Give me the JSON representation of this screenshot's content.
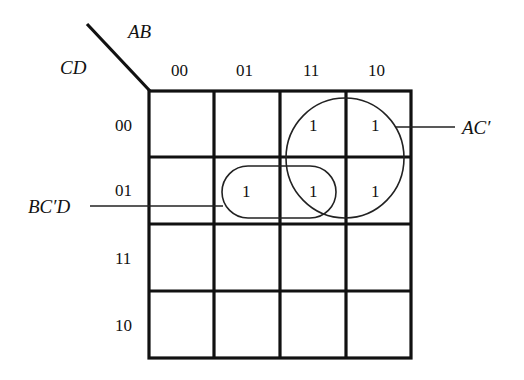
{
  "diagram": {
    "type": "karnaugh-map",
    "row_variable_label": "CD",
    "column_variable_label": "AB",
    "column_codes": [
      "00",
      "01",
      "11",
      "10"
    ],
    "row_codes": [
      "00",
      "01",
      "11",
      "10"
    ],
    "cells": [
      [
        "",
        "",
        "1",
        "1"
      ],
      [
        "",
        "1",
        "1",
        "1"
      ],
      [
        "",
        "",
        "",
        ""
      ],
      [
        "",
        "",
        "",
        ""
      ]
    ],
    "groups": [
      {
        "label": "AC'",
        "shape": "circle",
        "covers": "AB=11,10 × CD=00,01"
      },
      {
        "label": "BC'D",
        "shape": "rounded-rectangle",
        "covers": "AB=01,11 × CD=01"
      }
    ]
  },
  "labels": {
    "ab": "AB",
    "cd": "CD",
    "col_0": "00",
    "col_1": "01",
    "col_2": "11",
    "col_3": "10",
    "row_0": "00",
    "row_1": "01",
    "row_2": "11",
    "row_3": "10",
    "group_ac": "AC′",
    "group_bcd": "BC′D"
  },
  "cell_values": {
    "r0c2": "1",
    "r0c3": "1",
    "r1c1": "1",
    "r1c2": "1",
    "r1c3": "1"
  }
}
